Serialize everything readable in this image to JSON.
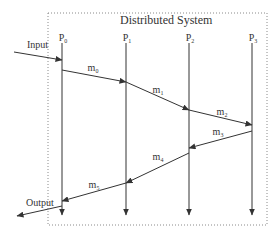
{
  "diagram": {
    "title": "Distributed System",
    "colors": {
      "line": "#333333",
      "frame": "#8a8a8a",
      "text": "#333333",
      "background": "#ffffff"
    },
    "frame": {
      "x": 48,
      "y": 13,
      "width": 219,
      "height": 212,
      "style": "dotted"
    },
    "processes": [
      {
        "id": "P0",
        "base": "P",
        "sub": "0",
        "x": 62
      },
      {
        "id": "P1",
        "base": "P",
        "sub": "1",
        "x": 126
      },
      {
        "id": "P2",
        "base": "P",
        "sub": "2",
        "x": 189
      },
      {
        "id": "P3",
        "base": "P",
        "sub": "3",
        "x": 252
      }
    ],
    "lifeline": {
      "top": 43,
      "bottom": 215
    },
    "input": {
      "label": "Input",
      "from": [
        14,
        52
      ],
      "to": [
        62,
        60
      ]
    },
    "output": {
      "label": "Output",
      "from": [
        62,
        206
      ],
      "to": [
        17,
        216
      ]
    },
    "messages": [
      {
        "id": "m0",
        "base": "m",
        "sub": "0",
        "from": "P0",
        "to": "P1",
        "y1": 70,
        "y2": 82
      },
      {
        "id": "m1",
        "base": "m",
        "sub": "1",
        "from": "P1",
        "to": "P2",
        "y1": 82,
        "y2": 110
      },
      {
        "id": "m2",
        "base": "m",
        "sub": "2",
        "from": "P2",
        "to": "P3",
        "y1": 110,
        "y2": 125
      },
      {
        "id": "m3",
        "base": "m",
        "sub": "3",
        "from": "P3",
        "to": "P2",
        "y1": 131,
        "y2": 148
      },
      {
        "id": "m4",
        "base": "m",
        "sub": "4",
        "from": "P2",
        "to": "P1",
        "y1": 153,
        "y2": 183
      },
      {
        "id": "m5",
        "base": "m",
        "sub": "5",
        "from": "P1",
        "to": "P0",
        "y1": 183,
        "y2": 201
      }
    ]
  }
}
